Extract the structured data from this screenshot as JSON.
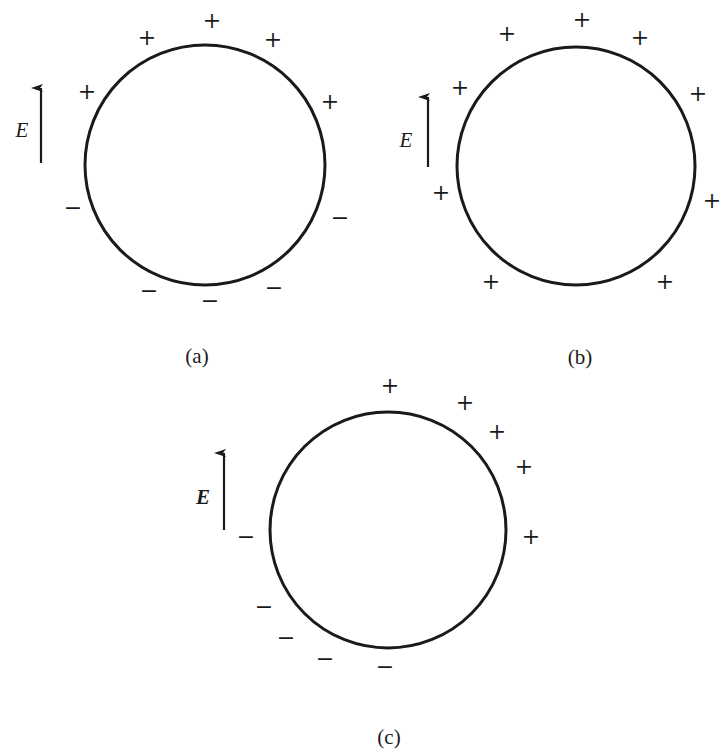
{
  "figure": {
    "colors": {
      "stroke": "#1a1a1a",
      "background": "#ffffff"
    },
    "panels": [
      {
        "id": "a",
        "caption": "(a)",
        "caption_pos": [
          197,
          356
        ],
        "circle": {
          "cx": 205,
          "cy": 165,
          "r": 120
        },
        "field": {
          "label": "E",
          "arrow_x": 41,
          "y_top": 88,
          "y_bottom": 163,
          "label_pos": [
            22,
            130
          ]
        },
        "charges": [
          {
            "sign": "+",
            "x": 147,
            "y": 38
          },
          {
            "sign": "+",
            "x": 212,
            "y": 21
          },
          {
            "sign": "+",
            "x": 273,
            "y": 40
          },
          {
            "sign": "+",
            "x": 87,
            "y": 92
          },
          {
            "sign": "+",
            "x": 330,
            "y": 102
          },
          {
            "sign": "−",
            "x": 73,
            "y": 208
          },
          {
            "sign": "−",
            "x": 340,
            "y": 218
          },
          {
            "sign": "−",
            "x": 149,
            "y": 291
          },
          {
            "sign": "−",
            "x": 210,
            "y": 301
          },
          {
            "sign": "−",
            "x": 274,
            "y": 288
          }
        ]
      },
      {
        "id": "b",
        "caption": "(b)",
        "caption_pos": [
          580,
          357
        ],
        "circle": {
          "cx": 576,
          "cy": 166,
          "r": 119
        },
        "field": {
          "label": "E",
          "arrow_x": 428,
          "y_top": 97,
          "y_bottom": 167,
          "label_pos": [
            406,
            140
          ]
        },
        "charges": [
          {
            "sign": "+",
            "x": 507,
            "y": 34
          },
          {
            "sign": "+",
            "x": 582,
            "y": 20
          },
          {
            "sign": "+",
            "x": 640,
            "y": 38
          },
          {
            "sign": "+",
            "x": 460,
            "y": 88
          },
          {
            "sign": "+",
            "x": 698,
            "y": 94
          },
          {
            "sign": "+",
            "x": 441,
            "y": 193
          },
          {
            "sign": "+",
            "x": 712,
            "y": 201
          },
          {
            "sign": "+",
            "x": 491,
            "y": 282
          },
          {
            "sign": "+",
            "x": 665,
            "y": 282
          }
        ]
      },
      {
        "id": "c",
        "caption": "(c)",
        "caption_pos": [
          389,
          737
        ],
        "circle": {
          "cx": 388,
          "cy": 530,
          "r": 118
        },
        "field": {
          "label": "E",
          "arrow_x": 224,
          "y_top": 453,
          "y_bottom": 530,
          "label_pos": [
            203,
            497
          ],
          "bold": true
        },
        "charges": [
          {
            "sign": "+",
            "x": 390,
            "y": 386
          },
          {
            "sign": "+",
            "x": 465,
            "y": 403
          },
          {
            "sign": "+",
            "x": 497,
            "y": 432
          },
          {
            "sign": "+",
            "x": 524,
            "y": 467
          },
          {
            "sign": "+",
            "x": 531,
            "y": 537
          },
          {
            "sign": "−",
            "x": 246,
            "y": 537
          },
          {
            "sign": "−",
            "x": 264,
            "y": 607
          },
          {
            "sign": "−",
            "x": 286,
            "y": 638
          },
          {
            "sign": "−",
            "x": 325,
            "y": 659
          },
          {
            "sign": "−",
            "x": 385,
            "y": 667
          }
        ]
      }
    ]
  }
}
